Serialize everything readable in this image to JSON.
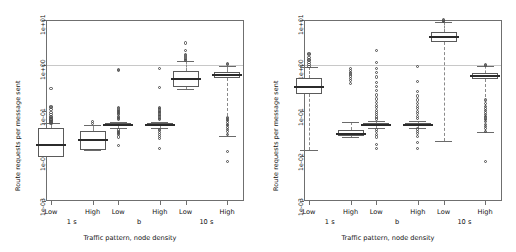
{
  "figure": {
    "panel_count": 2,
    "y_axis_title": "Route requests per message sent",
    "x_axis_title": "Traffic pattern, node density",
    "y_ticks": [
      "1e-03",
      "1e-02",
      "1e-01",
      "1e+00",
      "1e+01"
    ],
    "category_labels": [
      "Low",
      "High"
    ],
    "group_labels": [
      "1 s",
      "b",
      "10 s"
    ],
    "reference_line_value": "1e+00",
    "colors": {
      "frame": "#6f6f6f",
      "box_border": "#5a5a5a",
      "median": "#2b2b2b",
      "whisker": "#8a8a8a",
      "outlier": "#4a4a4a",
      "reference_line": "#c8c8c8",
      "background": "#ffffff"
    }
  },
  "chart_data": {
    "type": "box",
    "title": "",
    "xlabel": "Traffic pattern, node density",
    "ylabel": "Route requests per message sent",
    "yscale": "log",
    "ylim": [
      0.001,
      10
    ],
    "ytick_labels": [
      "1e-03",
      "1e-02",
      "1e-01",
      "1e+00",
      "1e+01"
    ],
    "ytick_values": [
      0.001,
      0.01,
      0.1,
      1,
      10
    ],
    "reference_lines": [
      {
        "y": 1,
        "style": "solid",
        "color": "#c8c8c8"
      }
    ],
    "groups": [
      "1 s",
      "b",
      "10 s"
    ],
    "categories": [
      "Low",
      "High"
    ],
    "panels": [
      {
        "name": "left",
        "boxes": [
          {
            "group": "1 s",
            "category": "Low",
            "whisker_low": 0.0105,
            "q1": 0.0095,
            "median": 0.0175,
            "q3": 0.041,
            "whisker_high": 0.052,
            "outliers": [
              0.052,
              0.055,
              0.058,
              0.06,
              0.062,
              0.065,
              0.07,
              0.075,
              0.08,
              0.092,
              0.105,
              0.115,
              0.125,
              0.3
            ]
          },
          {
            "group": "1 s",
            "category": "High",
            "whisker_low": 0.0135,
            "q1": 0.0135,
            "median": 0.022,
            "q3": 0.035,
            "whisker_high": 0.049,
            "outliers": [
              0.052,
              0.056
            ]
          },
          {
            "group": "b",
            "category": "Low",
            "whisker_low": 0.041,
            "q1": 0.045,
            "median": 0.048,
            "q3": 0.052,
            "whisker_high": 0.057,
            "outliers": [
              0.0165,
              0.026,
              0.029,
              0.031,
              0.033,
              0.035,
              0.037,
              0.062,
              0.066,
              0.07,
              0.075,
              0.08,
              0.085,
              0.09,
              0.095,
              0.1,
              0.108,
              0.115,
              0.78,
              0.82
            ]
          },
          {
            "group": "b",
            "category": "High",
            "whisker_low": 0.041,
            "q1": 0.045,
            "median": 0.048,
            "q3": 0.052,
            "whisker_high": 0.057,
            "outliers": [
              0.0145,
              0.024,
              0.027,
              0.03,
              0.033,
              0.036,
              0.038,
              0.062,
              0.067,
              0.072,
              0.078,
              0.084,
              0.09,
              0.096,
              0.103,
              0.11,
              0.117,
              0.32,
              0.86
            ]
          },
          {
            "group": "10 s",
            "category": "Low",
            "whisker_low": 0.3,
            "q1": 0.33,
            "median": 0.5,
            "q3": 0.74,
            "whisker_high": 1.25,
            "outliers": [
              1.25,
              1.35,
              1.45,
              1.6,
              1.75,
              2.1,
              3.1
            ]
          },
          {
            "group": "10 s",
            "category": "High",
            "whisker_low": 0.028,
            "q1": 0.52,
            "median": 0.6,
            "q3": 0.7,
            "whisker_high": 0.95,
            "outliers": [
              0.0075,
              0.0125,
              0.03,
              0.034,
              0.038,
              0.042,
              0.046,
              0.05,
              0.055,
              0.06,
              0.065,
              0.07,
              1.02,
              1.08
            ]
          }
        ]
      },
      {
        "name": "right",
        "boxes": [
          {
            "group": "1 s",
            "category": "Low",
            "whisker_low": 0.0135,
            "q1": 0.23,
            "median": 0.33,
            "q3": 0.52,
            "whisker_high": 0.9,
            "outliers": [
              0.95,
              1.05,
              1.15,
              1.25,
              1.35,
              1.5,
              1.75,
              1.85
            ]
          },
          {
            "group": "1 s",
            "category": "High",
            "whisker_low": 0.026,
            "q1": 0.028,
            "median": 0.031,
            "q3": 0.037,
            "whisker_high": 0.056,
            "outliers": [
              0.4,
              0.46,
              0.52,
              0.58,
              0.64,
              0.7,
              0.78,
              0.85
            ]
          },
          {
            "group": "b",
            "category": "Low",
            "whisker_low": 0.041,
            "q1": 0.045,
            "median": 0.048,
            "q3": 0.052,
            "whisker_high": 0.058,
            "outliers": [
              0.0145,
              0.018,
              0.026,
              0.03,
              0.034,
              0.038,
              0.065,
              0.072,
              0.08,
              0.09,
              0.1,
              0.115,
              0.13,
              0.15,
              0.18,
              0.22,
              0.28,
              0.34,
              0.42,
              0.55,
              0.7,
              0.85,
              1.15,
              2.1
            ]
          },
          {
            "group": "b",
            "category": "High",
            "whisker_low": 0.041,
            "q1": 0.045,
            "median": 0.048,
            "q3": 0.052,
            "whisker_high": 0.058,
            "outliers": [
              0.0145,
              0.02,
              0.027,
              0.031,
              0.035,
              0.039,
              0.066,
              0.074,
              0.085,
              0.095,
              0.11,
              0.125,
              0.145,
              0.17,
              0.21,
              0.26,
              0.44,
              0.95
            ]
          },
          {
            "group": "10 s",
            "category": "Low",
            "whisker_low": 0.021,
            "q1": 3.3,
            "median": 4.3,
            "q3": 5.4,
            "whisker_high": 9.2,
            "outliers": [
              9.2,
              9.6,
              10.0
            ]
          },
          {
            "group": "10 s",
            "category": "High",
            "whisker_low": 0.034,
            "q1": 0.5,
            "median": 0.58,
            "q3": 0.68,
            "whisker_high": 0.95,
            "outliers": [
              0.0075,
              0.035,
              0.04,
              0.045,
              0.05,
              0.056,
              0.062,
              0.068,
              0.075,
              0.082,
              0.09,
              0.1,
              0.11,
              0.125,
              0.145,
              0.17,
              1.0,
              1.05
            ]
          }
        ]
      }
    ]
  }
}
